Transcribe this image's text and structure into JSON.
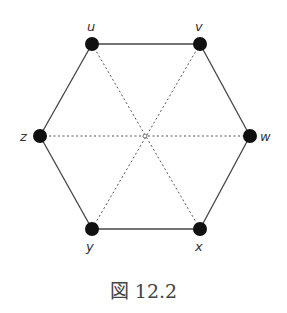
{
  "diagram": {
    "caption": "図 12.2",
    "nodes": [
      {
        "id": "u",
        "label": "u",
        "x": 92,
        "y": 44
      },
      {
        "id": "v",
        "label": "v",
        "x": 200,
        "y": 44
      },
      {
        "id": "w",
        "label": "w",
        "x": 250,
        "y": 136
      },
      {
        "id": "x",
        "label": "x",
        "x": 200,
        "y": 229
      },
      {
        "id": "y",
        "label": "y",
        "x": 92,
        "y": 229
      },
      {
        "id": "z",
        "label": "z",
        "x": 40,
        "y": 136
      }
    ],
    "solid_edges": [
      [
        "u",
        "v"
      ],
      [
        "v",
        "w"
      ],
      [
        "w",
        "x"
      ],
      [
        "x",
        "y"
      ],
      [
        "y",
        "z"
      ],
      [
        "z",
        "u"
      ]
    ],
    "dotted_edges": [
      [
        "u",
        "x"
      ],
      [
        "v",
        "y"
      ],
      [
        "z",
        "w"
      ]
    ],
    "center": {
      "x": 145,
      "y": 136
    }
  }
}
